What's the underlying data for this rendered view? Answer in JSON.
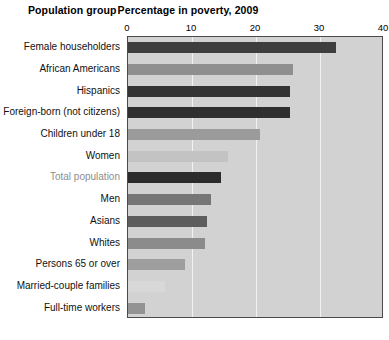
{
  "header": {
    "left_title": "Population group",
    "right_title": "Percentage in poverty, 2009"
  },
  "colors": {
    "plot_background": "#d2d2d2",
    "plot_border": "#4a4a4a",
    "gridline": "#f2f2f2",
    "label_default": "#111111",
    "label_highlight": "#8d8d8d"
  },
  "chart_data": {
    "type": "bar",
    "orientation": "horizontal",
    "title": "Percentage in poverty, 2009",
    "xlabel": "Percentage in poverty, 2009",
    "ylabel": "Population group",
    "xlim": [
      0,
      40
    ],
    "xticks": [
      0,
      10,
      20,
      30,
      40
    ],
    "xtick_labels": [
      "0",
      "10",
      "20",
      "30",
      "40"
    ],
    "grid": true,
    "grid_axis": "x",
    "legend": false,
    "categories": [
      "Female householders",
      "African Americans",
      "Hispanics",
      "Foreign-born (not citizens)",
      "Children under 18",
      "Women",
      "Total population",
      "Men",
      "Asians",
      "Whites",
      "Persons 65 or over",
      "Married-couple families",
      "Full-time workers"
    ],
    "values": [
      32.5,
      25.8,
      25.3,
      25.3,
      20.7,
      15.6,
      14.5,
      13.0,
      12.3,
      12.1,
      8.9,
      5.8,
      2.7
    ],
    "bar_colors": [
      "#3e3e3e",
      "#8f8f8f",
      "#343434",
      "#2f2f2f",
      "#9b9b9b",
      "#c3c3c3",
      "#2b2b2b",
      "#767676",
      "#5d5d5d",
      "#8b8b8b",
      "#9e9e9e",
      "#d8d8d8",
      "#939393"
    ],
    "highlight_category": "Total population"
  }
}
